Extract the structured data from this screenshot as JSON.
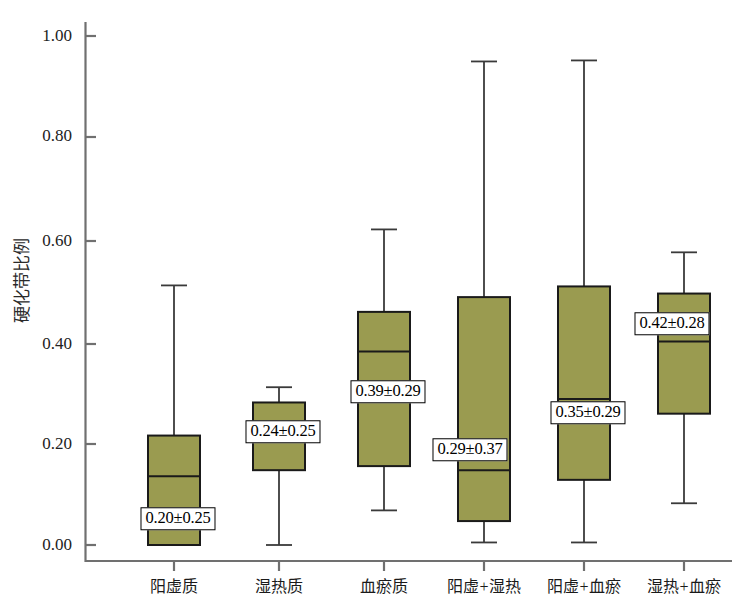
{
  "chart_data": {
    "type": "box",
    "title": "",
    "xlabel": "",
    "ylabel": "硬化带比例",
    "ylim": [
      0.0,
      1.05
    ],
    "grid": false,
    "legend": null,
    "ytick_labels": [
      "1.00",
      "0.80",
      "0.60",
      "0.40",
      "0.20",
      "0.00"
    ],
    "ytick_values": [
      1.0,
      0.8,
      0.6,
      0.4,
      0.2,
      0.0
    ],
    "categories": [
      "阳虚质",
      "湿热质",
      "血瘀质",
      "阳虚+湿热",
      "阳虚+血瘀",
      "湿热+血瘀"
    ],
    "annotations": [
      "0.20±0.25",
      "0.24±0.25",
      "0.39±0.29",
      "0.35±0.29",
      "0.29±0.37",
      "0.42±0.28"
    ],
    "boxes": [
      {
        "category": "阳虚质",
        "label": "0.20±0.25",
        "mean": 0.2,
        "sd": 0.25,
        "whisker_high": 0.51,
        "q3": 0.215,
        "median": 0.135,
        "q1": 0.0,
        "whisker_low": 0.0
      },
      {
        "category": "湿热质",
        "label": "0.24±0.25",
        "mean": 0.24,
        "sd": 0.25,
        "whisker_high": 0.31,
        "q3": 0.28,
        "median": 0.235,
        "q1": 0.147,
        "whisker_low": 0.0
      },
      {
        "category": "血瘀质",
        "label": "0.39±0.29",
        "mean": 0.39,
        "sd": 0.29,
        "whisker_high": 0.62,
        "q3": 0.458,
        "median": 0.38,
        "q1": 0.155,
        "whisker_low": 0.068
      },
      {
        "category": "阳虚+湿热",
        "label": "0.29±0.37",
        "mean": 0.29,
        "sd": 0.37,
        "whisker_high": 0.95,
        "q3": 0.487,
        "median": 0.147,
        "q1": 0.047,
        "whisker_low": 0.005
      },
      {
        "category": "阳虚+血瘀",
        "label": "0.35±0.29",
        "mean": 0.35,
        "sd": 0.29,
        "whisker_high": 0.952,
        "q3": 0.508,
        "median": 0.287,
        "q1": 0.128,
        "whisker_low": 0.005
      },
      {
        "category": "湿热+血瘀",
        "label": "0.42±0.28",
        "mean": 0.42,
        "sd": 0.28,
        "whisker_high": 0.575,
        "q3": 0.494,
        "median": 0.4,
        "q1": 0.258,
        "whisker_low": 0.082
      }
    ],
    "colors": {
      "box_fill": "#9a9b50",
      "box_edge": "#1a1a1a",
      "whisker": "#3a3a3a",
      "axis": "#707070",
      "text": "#1a1a1a"
    }
  }
}
